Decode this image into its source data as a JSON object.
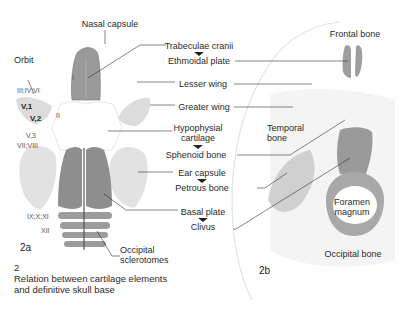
{
  "figure": {
    "number": "2",
    "caption_line1": "Relation between cartilage elements",
    "caption_line2": "and definitive skull base"
  },
  "panel_a": {
    "tag": "2a",
    "labels": {
      "nasal_capsule": "Nasal capsule",
      "orbit": "Orbit",
      "trabeculae": "Trabeculae cranii",
      "ethmoidal": "Ethmoidal plate",
      "lesser_wing": "Lesser wing",
      "greater_wing": "Greater wing",
      "hypophysial_1": "Hypophysial",
      "hypophysial_2": "cartilage",
      "sphenoid": "Sphenoid bone",
      "ear_capsule": "Ear capsule",
      "petrous": "Petrous bone",
      "basal_plate": "Basal plate",
      "clivus": "Clivus",
      "occipital_scl_1": "Occipital",
      "occipital_scl_2": "sclerotomes"
    },
    "nerves": {
      "n1": "I",
      "n2": "II",
      "n346": "III;IV;VI",
      "v1": "V,1",
      "v2": "V,2",
      "v3": "V,3",
      "n78": "VII;VIII",
      "n91011": "IX;X;XI",
      "n12": "XII"
    }
  },
  "panel_b": {
    "tag": "2b",
    "labels": {
      "frontal": "Frontal bone",
      "temporal_1": "Temporal",
      "temporal_2": "bone",
      "foramen_1": "Foramen",
      "foramen_2": "magnum",
      "occipital": "Occipital bone"
    }
  },
  "colors": {
    "cartilage_dark": "#8e8e8e",
    "cartilage_light": "#d9d9d9",
    "bone_mid": "#a8a8a8",
    "line": "#333333"
  }
}
